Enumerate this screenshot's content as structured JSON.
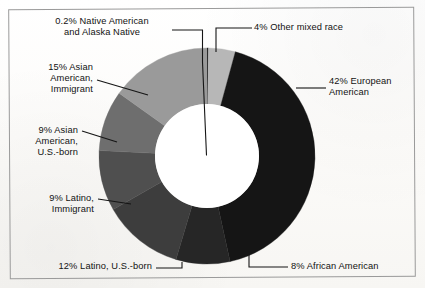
{
  "figure": {
    "kind": "donut-chart",
    "background_color": "#fbfaf8",
    "frame_border_color": "#9a9a9a",
    "hole_color": "#ffffff"
  },
  "chart_data": {
    "type": "pie",
    "variant": "donut",
    "title": "",
    "subtitle": "",
    "xlabel": "",
    "ylabel": "",
    "legend_position": "callout-labels",
    "grid": false,
    "start_angle_deg": 0,
    "direction": "clockwise",
    "units": "percent",
    "total": 99.2,
    "categories": [
      "Other mixed race",
      "European American",
      "African American",
      "Latino, U.S.-born",
      "Latino, Immigrant",
      "Asian American, U.S.-born",
      "Asian American, Immigrant",
      "Native American and Alaska Native"
    ],
    "values": [
      4,
      42,
      8,
      12,
      9,
      9,
      15,
      0.2
    ],
    "colors": [
      "#b7b7b7",
      "#151515",
      "#262626",
      "#3d3d3d",
      "#4f4f4f",
      "#6e6e6e",
      "#9a9a9a",
      "#000000"
    ],
    "slices": [
      {
        "label": "4% Other mixed race",
        "name": "Other mixed race",
        "value": 4,
        "color": "#b7b7b7",
        "label_lines": [
          "4% Other mixed race"
        ]
      },
      {
        "label": "42% European American",
        "name": "European American",
        "value": 42,
        "color": "#151515",
        "label_lines": [
          "42% European",
          "American"
        ]
      },
      {
        "label": "8% African American",
        "name": "African American",
        "value": 8,
        "color": "#262626",
        "label_lines": [
          "8% African American"
        ]
      },
      {
        "label": "12% Latino, U.S.-born",
        "name": "Latino, U.S.-born",
        "value": 12,
        "color": "#3d3d3d",
        "label_lines": [
          "12% Latino, U.S.-born"
        ]
      },
      {
        "label": "9% Latino, Immigrant",
        "name": "Latino, Immigrant",
        "value": 9,
        "color": "#4f4f4f",
        "label_lines": [
          "9% Latino,",
          "Immigrant"
        ]
      },
      {
        "label": "9% Asian American, U.S.-born",
        "name": "Asian American, U.S.-born",
        "value": 9,
        "color": "#6e6e6e",
        "label_lines": [
          "9% Asian",
          "American,",
          "U.S.-born"
        ]
      },
      {
        "label": "15% Asian American, Immigrant",
        "name": "Asian American, Immigrant",
        "value": 15,
        "color": "#9a9a9a",
        "label_lines": [
          "15% Asian",
          "American,",
          "Immigrant"
        ]
      },
      {
        "label": "0.2% Native American and Alaska Native",
        "name": "Native American and Alaska Native",
        "value": 0.2,
        "color": "#000000",
        "label_lines": [
          "0.2% Native American",
          "and Alaska Native"
        ]
      }
    ]
  },
  "callouts": {
    "native_american": "0.2% Native American\nand Alaska Native",
    "other_mixed_race": "4% Other mixed race",
    "european_american": "42% European\nAmerican",
    "african_american": "8% African American",
    "latino_us_born": "12% Latino, U.S.-born",
    "latino_immigrant": "9% Latino,\nImmigrant",
    "asian_american_us_born": "9% Asian\nAmerican,\nU.S.-born",
    "asian_american_immigrant": "15% Asian\nAmerican,\nImmigrant"
  }
}
